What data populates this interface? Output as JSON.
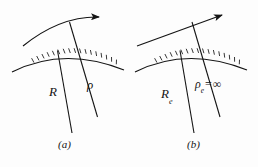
{
  "figure": {
    "panels": [
      {
        "id": "a",
        "caption": "(a)",
        "trajectory_type": "curved-arc-with-arrow",
        "labels": {
          "radius_earth": "R",
          "radius_path": "ρ"
        }
      },
      {
        "id": "b",
        "caption": "(b)",
        "trajectory_type": "straight-line-with-arrow",
        "labels": {
          "radius_earth_symbol": "R",
          "radius_earth_subscript": "e",
          "radius_path_symbol": "ρ",
          "radius_path_subscript": "e",
          "radius_path_relation": "=",
          "radius_path_value": "∞"
        }
      }
    ],
    "colors": {
      "ink": "#141414",
      "background": "#fdfdfd"
    }
  }
}
